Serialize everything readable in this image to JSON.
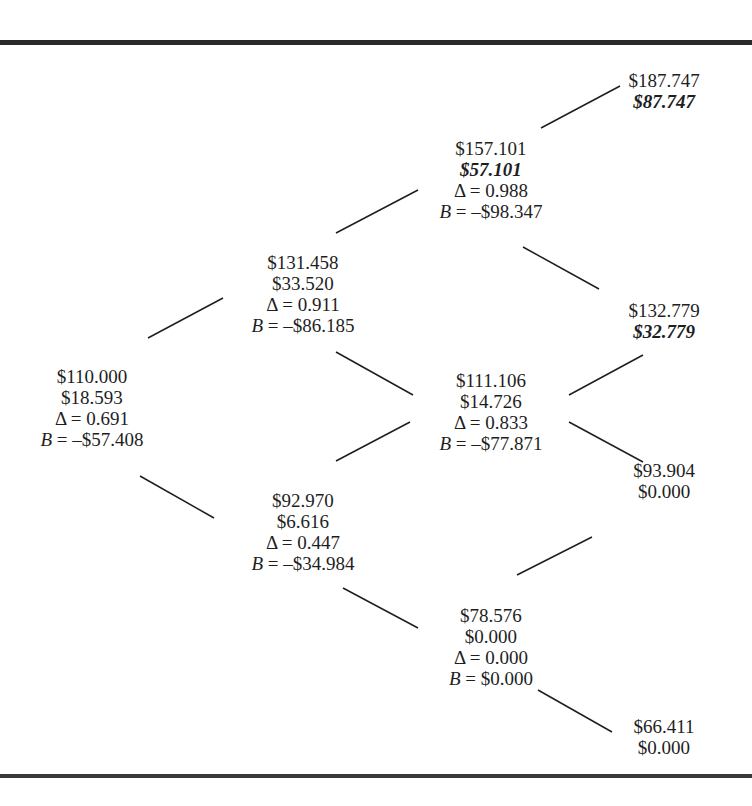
{
  "nodes": [
    {
      "id": "n0",
      "x": 92,
      "y": 366,
      "lines": [
        {
          "text": "$110.000"
        },
        {
          "text": "$18.593"
        },
        {
          "text": "Δ = 0.691"
        },
        {
          "var": "B",
          "text": " = –$57.408"
        }
      ]
    },
    {
      "id": "u1",
      "x": 303,
      "y": 252,
      "lines": [
        {
          "text": "$131.458"
        },
        {
          "text": "$33.520"
        },
        {
          "text": "Δ = 0.911"
        },
        {
          "var": "B",
          "text": " = –$86.185"
        }
      ]
    },
    {
      "id": "d1",
      "x": 303,
      "y": 490,
      "lines": [
        {
          "text": "$92.970"
        },
        {
          "text": "$6.616"
        },
        {
          "text": "Δ = 0.447"
        },
        {
          "var": "B",
          "text": " = –$34.984"
        }
      ]
    },
    {
      "id": "uu2",
      "x": 491,
      "y": 138,
      "lines": [
        {
          "text": "$157.101"
        },
        {
          "text": "$57.101",
          "bold": true
        },
        {
          "text": "Δ = 0.988"
        },
        {
          "var": "B",
          "text": " = –$98.347"
        }
      ]
    },
    {
      "id": "ud2",
      "x": 491,
      "y": 370,
      "lines": [
        {
          "text": "$111.106"
        },
        {
          "text": "$14.726"
        },
        {
          "text": "Δ = 0.833"
        },
        {
          "var": "B",
          "text": " = –$77.871"
        }
      ]
    },
    {
      "id": "dd2",
      "x": 491,
      "y": 605,
      "lines": [
        {
          "text": "$78.576"
        },
        {
          "text": "$0.000"
        },
        {
          "text": "Δ = 0.000"
        },
        {
          "var": "B",
          "text": " = $0.000"
        }
      ]
    },
    {
      "id": "uuu3",
      "x": 664,
      "y": 70,
      "lines": [
        {
          "text": "$187.747"
        },
        {
          "text": "$87.747",
          "bold": true
        }
      ]
    },
    {
      "id": "uud3",
      "x": 664,
      "y": 300,
      "lines": [
        {
          "text": "$132.779"
        },
        {
          "text": "$32.779",
          "bold": true
        }
      ]
    },
    {
      "id": "udd3",
      "x": 664,
      "y": 460,
      "lines": [
        {
          "text": "$93.904"
        },
        {
          "text": "$0.000"
        }
      ]
    },
    {
      "id": "ddd3",
      "x": 664,
      "y": 716,
      "lines": [
        {
          "text": "$66.411"
        },
        {
          "text": "$0.000"
        }
      ]
    }
  ],
  "edges": [
    {
      "from": "n0",
      "to": "u1",
      "x1": 148,
      "y1": 338,
      "x2": 223,
      "y2": 298
    },
    {
      "from": "n0",
      "to": "d1",
      "x1": 140,
      "y1": 476,
      "x2": 214,
      "y2": 518
    },
    {
      "from": "u1",
      "to": "uu2",
      "x1": 336,
      "y1": 233,
      "x2": 418,
      "y2": 190
    },
    {
      "from": "u1",
      "to": "ud2",
      "x1": 336,
      "y1": 352,
      "x2": 413,
      "y2": 395
    },
    {
      "from": "d1",
      "to": "ud2",
      "x1": 336,
      "y1": 461,
      "x2": 410,
      "y2": 422
    },
    {
      "from": "d1",
      "to": "dd2",
      "x1": 343,
      "y1": 588,
      "x2": 418,
      "y2": 628
    },
    {
      "from": "uu2",
      "to": "uuu3",
      "x1": 541,
      "y1": 128,
      "x2": 620,
      "y2": 86
    },
    {
      "from": "uu2",
      "to": "uud3",
      "x1": 523,
      "y1": 247,
      "x2": 599,
      "y2": 289
    },
    {
      "from": "ud2",
      "to": "uud3",
      "x1": 569,
      "y1": 395,
      "x2": 643,
      "y2": 355
    },
    {
      "from": "ud2",
      "to": "udd3",
      "x1": 569,
      "y1": 422,
      "x2": 643,
      "y2": 462
    },
    {
      "from": "dd2",
      "to": "udd3",
      "x1": 517,
      "y1": 575,
      "x2": 592,
      "y2": 537
    },
    {
      "from": "dd2",
      "to": "ddd3",
      "x1": 538,
      "y1": 690,
      "x2": 612,
      "y2": 732
    }
  ]
}
